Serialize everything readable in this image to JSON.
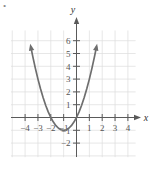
{
  "figure": {
    "kind": "coordinate-plane-parabola",
    "axis_labels": {
      "x": "x",
      "y": "y"
    },
    "bullet_marker": "•",
    "colors": {
      "grid": "#dcdcdc",
      "axis": "#5a5a5a",
      "curve": "#6e6e6e",
      "label_text": "#555555",
      "background": "#ffffff"
    }
  },
  "chart_data": {
    "type": "line",
    "title": "",
    "subtitle": "",
    "xlabel": "x",
    "ylabel": "y",
    "xlim": [
      -5,
      5
    ],
    "ylim": [
      -3,
      7
    ],
    "grid": true,
    "legend": null,
    "x_ticks": [
      -4,
      -3,
      -2,
      -1,
      1,
      2,
      3,
      4
    ],
    "x_tick_labels": [
      "−4",
      "−3",
      "−2",
      "−1",
      "1",
      "2",
      "3",
      "4"
    ],
    "y_ticks": [
      -2,
      -1,
      1,
      2,
      3,
      4,
      5,
      6
    ],
    "y_tick_labels": [
      "−2",
      "−1",
      "1",
      "2",
      "3",
      "4",
      "5",
      "6"
    ],
    "annotations": [],
    "series": [
      {
        "name": "parabola",
        "equation": "y = (x + 1)^2 - 1",
        "vertex": [
          -1,
          -1
        ],
        "x_intercepts": [
          -2,
          0
        ],
        "y_intercept": 0,
        "arrow_ends": [
          "left-up",
          "right-up"
        ],
        "x": [
          -3.55,
          -3.4,
          -3.2,
          -3.0,
          -2.8,
          -2.6,
          -2.4,
          -2.2,
          -2.0,
          -1.8,
          -1.6,
          -1.4,
          -1.2,
          -1.0,
          -0.8,
          -0.6,
          -0.4,
          -0.2,
          0.0,
          0.2,
          0.4,
          0.6,
          0.8,
          1.0,
          1.2,
          1.4,
          1.55
        ],
        "y": [
          5.5,
          4.76,
          3.84,
          3.0,
          2.24,
          1.56,
          0.96,
          0.44,
          0.0,
          -0.36,
          -0.64,
          -0.84,
          -0.96,
          -1.0,
          -0.96,
          -0.84,
          -0.64,
          -0.36,
          0.0,
          0.44,
          0.96,
          1.56,
          2.24,
          3.0,
          3.84,
          4.76,
          5.5
        ]
      }
    ]
  }
}
